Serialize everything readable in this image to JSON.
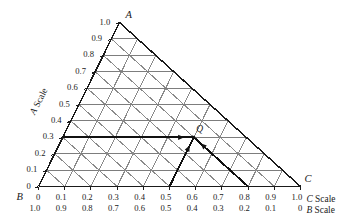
{
  "figure": {
    "type": "ternary-diagram",
    "title": "",
    "vertices": [
      {
        "name": "A",
        "label": "A",
        "position": "apex"
      },
      {
        "name": "B",
        "label": "B",
        "position": "bottom-left"
      },
      {
        "name": "C",
        "label": "C",
        "position": "bottom-right"
      }
    ],
    "axis_names": {
      "left": "A Scale",
      "bottom_upper": "C Scale",
      "bottom_lower": "B Scale"
    },
    "axis_name_parts": {
      "a_letter": "A",
      "a_word": "Scale",
      "c_letter": "C",
      "c_word": "Scale",
      "b_letter": "B",
      "b_word": "Scale"
    },
    "left_ticks": [
      "1.0",
      "0.9",
      "0.8",
      "0.7",
      "0.6",
      "0.5",
      "0.4",
      "0.3",
      "0.2",
      "0.1",
      "0"
    ],
    "bottom_ticks_c": [
      "0",
      "0.1",
      "0.2",
      "0.3",
      "0.4",
      "0.5",
      "0.6",
      "0.7",
      "0.8",
      "0.9",
      "1.0"
    ],
    "bottom_ticks_b": [
      "1.0",
      "0.9",
      "0.8",
      "0.7",
      "0.6",
      "0.5",
      "0.4",
      "0.3",
      "0.2",
      "0.1",
      "0"
    ],
    "grid": {
      "divisions": 10,
      "visible": true
    },
    "point": {
      "label": "Q",
      "a": 0.3,
      "b": 0.2,
      "c": 0.5
    },
    "construction_lines": [
      {
        "name": "a-constant-line",
        "value": 0.3,
        "direction": "horizontal",
        "arrow": "right"
      },
      {
        "name": "c-constant-line",
        "value": 0.5,
        "direction": "down-left",
        "arrow": "up-right"
      },
      {
        "name": "b-constant-line",
        "value": 0.2,
        "direction": "down-right",
        "arrow": "up-left"
      }
    ],
    "colors": {
      "outline": "#1a1a1a",
      "grid": "#8a8a8a",
      "grid_horizontal": "#7d7d7d",
      "highlight": "#111111",
      "background": "#ffffff"
    }
  },
  "chart_data": {
    "type": "scatter",
    "title": "",
    "xlabel": "C Scale",
    "ylabel": "A Scale",
    "categories": [
      "A",
      "B",
      "C"
    ],
    "series": [
      {
        "name": "Q",
        "values": [
          0.3,
          0.2,
          0.5
        ]
      }
    ],
    "axis_ranges": {
      "A": [
        0,
        1.0
      ],
      "B": [
        0,
        1.0
      ],
      "C": [
        0,
        1.0
      ]
    },
    "tick_step": 0.1,
    "grid": true,
    "legend": "none",
    "annotations": [
      "Q"
    ]
  }
}
